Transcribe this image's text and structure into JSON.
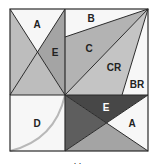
{
  "diagram": {
    "type": "quilt-block-piecing-diagram",
    "colors": {
      "white": "#f7f7f7",
      "light": "#bdbdbd",
      "medium": "#a4a4a4",
      "dark": "#4a4a4a",
      "stroke": "#2b2b2b",
      "arc": "#b8b8b8"
    },
    "labels": {
      "top_left_a": "A",
      "top_left_e": "E",
      "top_right_b": "B",
      "top_right_c": "C",
      "top_right_cr": "CR",
      "top_right_br": "BR",
      "bottom_left_d": "D",
      "bottom_right_e": "E",
      "bottom_right_a": "A"
    },
    "caption": ". ."
  }
}
